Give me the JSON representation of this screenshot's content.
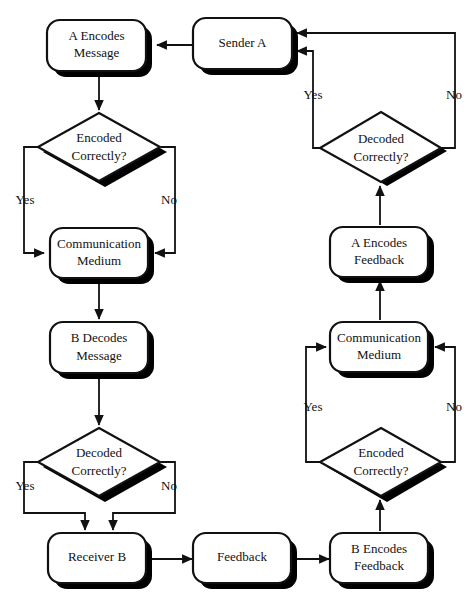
{
  "diagram": {
    "colors": {
      "shape_fill": "#ffffff",
      "shape_stroke": "#111111",
      "shadow": "#000000",
      "text": "#111111",
      "background": "#ffffff"
    },
    "nodes": [
      {
        "id": "a_encodes_message",
        "shape": "process",
        "line1": "A Encodes",
        "line2": "Message"
      },
      {
        "id": "sender_a",
        "shape": "process",
        "line1": "Sender A",
        "line2": ""
      },
      {
        "id": "encoded_correctly_l",
        "shape": "decision",
        "line1": "Encoded",
        "line2": "Correctly?"
      },
      {
        "id": "comm_medium_l",
        "shape": "process",
        "line1": "Communication",
        "line2": "Medium"
      },
      {
        "id": "b_decodes_message",
        "shape": "process",
        "line1": "B Decodes",
        "line2": "Message"
      },
      {
        "id": "decoded_correctly_l",
        "shape": "decision",
        "line1": "Decoded",
        "line2": "Correctly?"
      },
      {
        "id": "receiver_b",
        "shape": "process",
        "line1": "Receiver B",
        "line2": ""
      },
      {
        "id": "feedback",
        "shape": "process",
        "line1": "Feedback",
        "line2": ""
      },
      {
        "id": "b_encodes_feedback",
        "shape": "process",
        "line1": "B Encodes",
        "line2": "Feedback"
      },
      {
        "id": "encoded_correctly_r",
        "shape": "decision",
        "line1": "Encoded",
        "line2": "Correctly?"
      },
      {
        "id": "comm_medium_r",
        "shape": "process",
        "line1": "Communication",
        "line2": "Medium"
      },
      {
        "id": "a_encodes_feedback",
        "shape": "process",
        "line1": "A Encodes",
        "line2": "Feedback"
      },
      {
        "id": "decoded_correctly_r",
        "shape": "decision",
        "line1": "Decoded",
        "line2": "Correctly?"
      }
    ],
    "edge_labels": [
      {
        "id": "enc_l_yes",
        "text": "Yes"
      },
      {
        "id": "enc_l_no",
        "text": "No"
      },
      {
        "id": "dec_l_yes",
        "text": "Yes"
      },
      {
        "id": "dec_l_no",
        "text": "No"
      },
      {
        "id": "enc_r_yes",
        "text": "Yes"
      },
      {
        "id": "enc_r_no",
        "text": "No"
      },
      {
        "id": "dec_r_yes",
        "text": "Yes"
      },
      {
        "id": "dec_r_no",
        "text": "No"
      }
    ]
  }
}
